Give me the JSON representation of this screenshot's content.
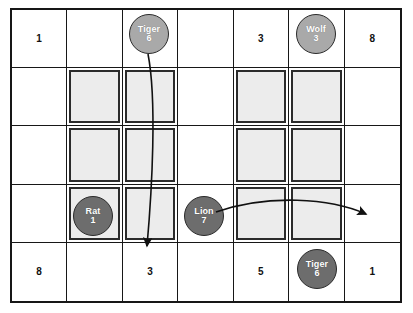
{
  "board": {
    "rows": 5,
    "cols": 7,
    "cells": [
      [
        {
          "number": "1",
          "shaded": false
        },
        {
          "number": "",
          "shaded": false
        },
        {
          "number": "",
          "shaded": false
        },
        {
          "number": "",
          "shaded": false
        },
        {
          "number": "3",
          "shaded": false
        },
        {
          "number": "",
          "shaded": false
        },
        {
          "number": "8",
          "shaded": false
        }
      ],
      [
        {
          "number": "",
          "shaded": false
        },
        {
          "number": "",
          "shaded": true
        },
        {
          "number": "",
          "shaded": true
        },
        {
          "number": "",
          "shaded": false
        },
        {
          "number": "",
          "shaded": true
        },
        {
          "number": "",
          "shaded": true
        },
        {
          "number": "",
          "shaded": false
        }
      ],
      [
        {
          "number": "",
          "shaded": false
        },
        {
          "number": "",
          "shaded": true
        },
        {
          "number": "",
          "shaded": true
        },
        {
          "number": "",
          "shaded": false
        },
        {
          "number": "",
          "shaded": true
        },
        {
          "number": "",
          "shaded": true
        },
        {
          "number": "",
          "shaded": false
        }
      ],
      [
        {
          "number": "",
          "shaded": false
        },
        {
          "number": "",
          "shaded": true
        },
        {
          "number": "",
          "shaded": true
        },
        {
          "number": "",
          "shaded": false
        },
        {
          "number": "",
          "shaded": true
        },
        {
          "number": "",
          "shaded": true
        },
        {
          "number": "",
          "shaded": false
        }
      ],
      [
        {
          "number": "8",
          "shaded": false
        },
        {
          "number": "",
          "shaded": false
        },
        {
          "number": "3",
          "shaded": false
        },
        {
          "number": "",
          "shaded": false
        },
        {
          "number": "5",
          "shaded": false
        },
        {
          "number": "",
          "shaded": false
        },
        {
          "number": "1",
          "shaded": false
        }
      ]
    ]
  },
  "tokens": [
    {
      "id": "tiger-top",
      "name": "Tiger",
      "value": "6",
      "shade": "light",
      "x": 129,
      "y": 14
    },
    {
      "id": "wolf-top",
      "name": "Wolf",
      "value": "3",
      "shade": "light",
      "x": 296,
      "y": 14
    },
    {
      "id": "rat",
      "name": "Rat",
      "value": "1",
      "shade": "dark",
      "x": 73,
      "y": 196
    },
    {
      "id": "lion",
      "name": "Lion",
      "value": "7",
      "shade": "dark",
      "x": 184,
      "y": 196
    },
    {
      "id": "tiger-bottom",
      "name": "Tiger",
      "value": "6",
      "shade": "dark",
      "x": 297,
      "y": 249
    }
  ],
  "arrows": [
    {
      "id": "tiger-move-arrow",
      "label": "Tiger moves down to bottom row",
      "path": "M 148 54 C 157 100 152 190 147 246",
      "color": "#111111"
    },
    {
      "id": "lion-move-arrow",
      "label": "Lion moves right across the river",
      "path": "M 216 212 C 268 194 330 198 366 214",
      "color": "#111111"
    }
  ],
  "colors": {
    "grid_line": "#171717",
    "shaded_fill": "#ececec",
    "shaded_border": "#2b2b2b",
    "token_light": "#a9a9a9",
    "token_dark": "#6d6d6d",
    "background": "#ffffff"
  }
}
